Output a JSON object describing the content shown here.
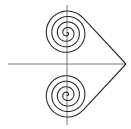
{
  "diagram": {
    "title": "",
    "colors": {
      "stroke": "#2a2a2a",
      "axis": "#555555",
      "background": "#ffffff"
    },
    "axes": {
      "horizontal": {
        "x1": 8,
        "y1": 64,
        "x2": 126,
        "y2": 64
      },
      "vertical": {
        "x1": 67,
        "y1": 5,
        "x2": 67,
        "y2": 125
      }
    },
    "spirals": [
      {
        "name": "upper-spiral",
        "cx": 67,
        "cy": 33,
        "outer_radius": 22,
        "turns": 4
      },
      {
        "name": "lower-spiral",
        "cx": 67,
        "cy": 95,
        "outer_radius": 22,
        "turns": 4
      }
    ],
    "apex": {
      "x": 126,
      "y": 64
    }
  }
}
